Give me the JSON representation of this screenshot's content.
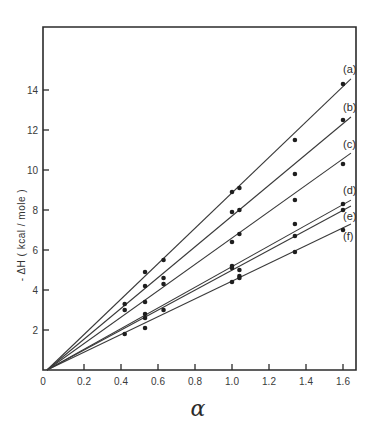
{
  "chart_data": {
    "type": "scatter",
    "title": "",
    "xlabel": "α",
    "ylabel": "- ΔH  ( kcal / mole )",
    "xlim": [
      0,
      1.66
    ],
    "ylim": [
      0,
      17.2
    ],
    "grid": false,
    "legend": "inline labels at right end of lines",
    "x_ticks": [
      0,
      0.2,
      0.4,
      0.6,
      0.8,
      1.0,
      1.2,
      1.4,
      1.6
    ],
    "x_tick_labels": [
      "0",
      "0.2",
      "0.4",
      "0.6",
      "0.8",
      "1.0",
      "1.2",
      "1.4",
      "1.6"
    ],
    "y_ticks": [
      2,
      4,
      6,
      8,
      10,
      12,
      14
    ],
    "y_tick_labels": [
      "2",
      "4",
      "6",
      "8",
      "10",
      "12",
      "14"
    ],
    "series": [
      {
        "name": "(a)",
        "slope": 8.86,
        "line_end_x": 1.643,
        "points": [
          [
            0.42,
            3.3
          ],
          [
            0.53,
            4.9
          ],
          [
            0.63,
            5.5
          ],
          [
            1.0,
            8.9
          ],
          [
            1.04,
            9.1
          ],
          [
            1.34,
            11.5
          ],
          [
            1.6,
            14.3
          ]
        ]
      },
      {
        "name": "(b)",
        "slope": 7.7,
        "line_end_x": 1.643,
        "points": [
          [
            0.42,
            3.0
          ],
          [
            0.53,
            4.2
          ],
          [
            0.63,
            4.6
          ],
          [
            1.0,
            7.9
          ],
          [
            1.04,
            8.0
          ],
          [
            1.34,
            9.8
          ],
          [
            1.6,
            12.5
          ]
        ]
      },
      {
        "name": "(c)",
        "slope": 6.6,
        "line_end_x": 1.643,
        "points": [
          [
            0.53,
            3.4
          ],
          [
            0.63,
            4.3
          ],
          [
            1.0,
            6.4
          ],
          [
            1.04,
            6.8
          ],
          [
            1.34,
            8.5
          ],
          [
            1.6,
            10.3
          ]
        ]
      },
      {
        "name": "(d)",
        "slope": 5.17,
        "line_end_x": 1.643,
        "points": [
          [
            0.53,
            2.8
          ],
          [
            0.63,
            3.0
          ],
          [
            1.0,
            5.2
          ],
          [
            1.04,
            5.0
          ],
          [
            1.34,
            7.3
          ],
          [
            1.6,
            8.3
          ]
        ]
      },
      {
        "name": "(e)",
        "slope": 4.99,
        "line_end_x": 1.643,
        "points": [
          [
            0.53,
            2.6
          ],
          [
            1.0,
            5.1
          ],
          [
            1.04,
            4.7
          ],
          [
            1.34,
            6.7
          ],
          [
            1.6,
            8.0
          ]
        ]
      },
      {
        "name": "(f)",
        "slope": 4.44,
        "line_end_x": 1.643,
        "points": [
          [
            0.42,
            1.8
          ],
          [
            0.53,
            2.1
          ],
          [
            1.0,
            4.4
          ],
          [
            1.04,
            4.6
          ],
          [
            1.34,
            5.9
          ],
          [
            1.6,
            7.0
          ]
        ]
      }
    ]
  },
  "layout": {
    "origin_px": [
      47,
      370
    ],
    "px_per_x": 185,
    "px_per_y": 20,
    "frame": {
      "left": 43,
      "right": 356,
      "top": 27,
      "bottom": 370
    },
    "label_offsets": {
      "(a)": [
        343,
        73
      ],
      "(b)": [
        343,
        111
      ],
      "(c)": [
        343,
        148
      ],
      "(d)": [
        343,
        194
      ],
      "(e)": [
        343,
        220
      ],
      "(f)": [
        343,
        240
      ]
    }
  }
}
